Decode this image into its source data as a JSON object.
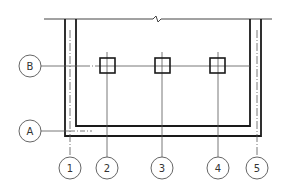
{
  "diagram": {
    "type": "structural-grid-plan",
    "line_color": "#1a1a1a",
    "thin_line_color": "#555555",
    "bubble_stroke": "#555555",
    "horizontal_axes": [
      {
        "label": "B",
        "y": 66
      },
      {
        "label": "A",
        "y": 131
      }
    ],
    "vertical_axes": [
      {
        "label": "1",
        "x": 70
      },
      {
        "label": "2",
        "x": 107
      },
      {
        "label": "3",
        "x": 162
      },
      {
        "label": "4",
        "x": 218
      },
      {
        "label": "5",
        "x": 257
      }
    ],
    "columns": [
      {
        "axis": "2",
        "x": 107,
        "y": 66
      },
      {
        "axis": "3",
        "x": 162,
        "y": 66
      },
      {
        "axis": "4",
        "x": 218,
        "y": 66
      }
    ],
    "break_symbol": "~"
  }
}
